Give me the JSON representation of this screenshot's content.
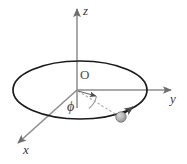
{
  "figure": {
    "background_color": "#ffffff",
    "labels": {
      "z_axis": "z",
      "y_axis": "y",
      "x_axis": "x",
      "origin": "O",
      "angle": "ϕ"
    },
    "colors": {
      "axis": "#8c8c8c",
      "circle": "#1a1a1a",
      "dashed": "#a0a0a0",
      "particle_fill": "#b5b5b5",
      "particle_edge": "#7a7a7a",
      "text": "#3a3a3a"
    },
    "geometry": {
      "origin": {
        "x": 77,
        "y": 90
      },
      "z_axis_tip": {
        "x": 77,
        "y": 5
      },
      "y_axis_tip": {
        "x": 176,
        "y": 90
      },
      "x_axis_tip": {
        "x": 13,
        "y": 148
      },
      "ellipse": {
        "cx": 80,
        "cy": 90,
        "rx": 67,
        "ry": 29
      },
      "particle": {
        "x": 121,
        "y": 117,
        "r": 5
      },
      "reference_arrow_tip": {
        "x": 99,
        "y": 97
      },
      "arc_radius": 20,
      "orbit_arrowhead": {
        "x": 131,
        "y": 109
      }
    },
    "elements": [
      {
        "name": "z-axis",
        "kind": "arrow"
      },
      {
        "name": "y-axis",
        "kind": "arrow"
      },
      {
        "name": "x-axis",
        "kind": "arrow"
      },
      {
        "name": "orbit-circle",
        "kind": "ellipse"
      },
      {
        "name": "orbit-direction-arrowhead",
        "kind": "arrowhead"
      },
      {
        "name": "radius-dashed-line",
        "kind": "dashed-line"
      },
      {
        "name": "reference-direction-arrow",
        "kind": "arrow"
      },
      {
        "name": "angle-arc",
        "kind": "arc"
      },
      {
        "name": "particle",
        "kind": "sphere"
      }
    ]
  }
}
